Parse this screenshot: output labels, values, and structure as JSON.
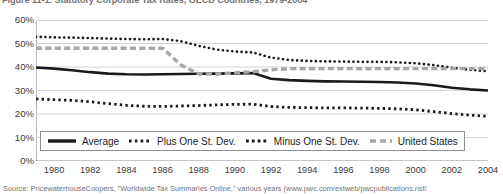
{
  "figure": {
    "title": "Figure 11-1. Statutory Corporate Tax Rates, OECD Countries, 1979-2004",
    "source": "Source: PricewaterhouseCoopers, \"Worldwide Tax Summaries Online,\" various years (www.pwc.com/extweb/pwcpublications.nsf/"
  },
  "legend": {
    "items": [
      {
        "label": "Average",
        "style": "solid",
        "color": "#1a1a1a"
      },
      {
        "label": "Plus One St. Dev.",
        "style": "dotted",
        "color": "#1a1a1a"
      },
      {
        "label": "Minus One St. Dev.",
        "style": "dotted-square",
        "color": "#1a1a1a"
      },
      {
        "label": "United States",
        "style": "dashed",
        "color": "#a6a6a6"
      }
    ]
  },
  "chart_data": {
    "type": "line",
    "title": "Figure 11-1. Statutory Corporate Tax Rates, OECD Countries, 1979-2004",
    "xlabel": "",
    "ylabel": "",
    "xlim": [
      1979,
      2004
    ],
    "ylim": [
      0,
      60
    ],
    "grid": true,
    "legend_position": "bottom",
    "y_ticks": [
      "0%",
      "10%",
      "20%",
      "30%",
      "40%",
      "50%",
      "60%"
    ],
    "y_tick_values": [
      0,
      10,
      20,
      30,
      40,
      50,
      60
    ],
    "x_ticks": [
      "1980",
      "1982",
      "1984",
      "1986",
      "1988",
      "1990",
      "1992",
      "1994",
      "1996",
      "1998",
      "2000",
      "2002",
      "2004"
    ],
    "x_tick_values": [
      1980,
      1982,
      1984,
      1986,
      1988,
      1990,
      1992,
      1994,
      1996,
      1998,
      2000,
      2002,
      2004
    ],
    "x": [
      1979,
      1980,
      1981,
      1982,
      1983,
      1984,
      1985,
      1986,
      1987,
      1988,
      1989,
      1990,
      1991,
      1992,
      1993,
      1994,
      1995,
      1996,
      1997,
      1998,
      1999,
      2000,
      2001,
      2002,
      2003,
      2004
    ],
    "series": [
      {
        "name": "Average",
        "style": "solid",
        "color": "#1a1a1a",
        "values": [
          39.8,
          39.3,
          38.6,
          37.8,
          37.2,
          36.9,
          36.8,
          36.9,
          37.0,
          37.1,
          37.2,
          37.3,
          37.4,
          35.0,
          34.4,
          34.1,
          33.9,
          33.8,
          33.7,
          33.6,
          33.4,
          33.0,
          32.2,
          31.2,
          30.5,
          30.0
        ]
      },
      {
        "name": "Plus One St. Dev.",
        "style": "dotted",
        "color": "#1a1a1a",
        "values": [
          52.9,
          52.6,
          52.5,
          52.3,
          52.1,
          51.9,
          51.8,
          51.9,
          51.0,
          49.0,
          47.4,
          46.6,
          46.2,
          44.0,
          43.0,
          42.6,
          42.4,
          42.3,
          42.2,
          42.2,
          42.0,
          41.6,
          40.8,
          39.7,
          38.8,
          38.2
        ]
      },
      {
        "name": "Minus One St. Dev.",
        "style": "dotted-square",
        "color": "#1a1a1a",
        "values": [
          26.4,
          26.1,
          25.8,
          25.2,
          24.4,
          23.7,
          23.3,
          23.2,
          23.4,
          23.6,
          23.9,
          24.1,
          24.2,
          23.2,
          22.8,
          22.7,
          22.6,
          22.6,
          22.5,
          22.4,
          22.2,
          21.8,
          21.0,
          20.2,
          19.5,
          19.0
        ]
      },
      {
        "name": "United States",
        "style": "dashed",
        "color": "#a6a6a6",
        "values": [
          48.0,
          48.0,
          48.0,
          48.0,
          48.0,
          48.0,
          48.0,
          48.0,
          41.0,
          37.0,
          37.0,
          37.5,
          38.0,
          38.8,
          39.3,
          39.3,
          39.3,
          39.3,
          39.3,
          39.3,
          39.3,
          39.3,
          39.3,
          39.3,
          39.3,
          39.3
        ]
      }
    ]
  }
}
